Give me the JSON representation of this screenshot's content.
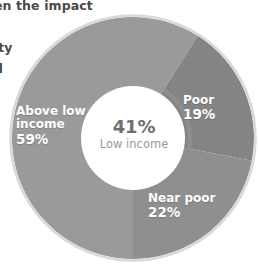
{
  "page": {
    "background_color": "#ffffff",
    "width": 258,
    "height": 272
  },
  "clipped_body_text": {
    "note": "partially cropped paragraph text at the left edge of the figure",
    "lines": [
      "en the impact",
      "e",
      "rty",
      "d"
    ]
  },
  "chart_data": {
    "type": "pie",
    "variant": "donut",
    "title": "",
    "subtitle": "",
    "xlabel": "",
    "ylabel": "",
    "legend_position": "inside-slices",
    "grid": false,
    "units": "percent",
    "total": 100,
    "categories": [
      "Above low income",
      "Poor",
      "Near poor"
    ],
    "values": [
      59,
      19,
      22
    ],
    "value_labels": [
      "59%",
      "19%",
      "22%"
    ],
    "colors": [
      "#9a9a9a",
      "#848484",
      "#8f8f8f"
    ],
    "slices": [
      {
        "name": "Above low income",
        "label_line1": "Above low",
        "label_line2": "income",
        "value": 59,
        "value_label": "59%",
        "color": "#9a9a9a",
        "label_color": "#ffffff"
      },
      {
        "name": "Poor",
        "label_line1": "Poor",
        "label_line2": "",
        "value": 19,
        "value_label": "19%",
        "color": "#848484",
        "label_color": "#ffffff"
      },
      {
        "name": "Near poor",
        "label_line1": "Near poor",
        "label_line2": "",
        "value": 22,
        "value_label": "22%",
        "color": "#8f8f8f",
        "label_color": "#ffffff"
      }
    ],
    "center_annotation": {
      "value": 41,
      "value_label": "41%",
      "caption": "Low income",
      "value_color": "#6f6f6f",
      "caption_color": "#9b9b9b",
      "arc_highlight_percent": 41,
      "arc_color": "#8e8e8e",
      "note": "arc traces the combined Poor + Near poor share"
    },
    "annotations": [
      {
        "text": "41%",
        "detail": "Low income = Poor (19%) + Near poor (22%)"
      }
    ],
    "outer_ring_outline_color": "#d9d9d9",
    "hole_color": "#ffffff",
    "hole_ratio": 0.41
  }
}
